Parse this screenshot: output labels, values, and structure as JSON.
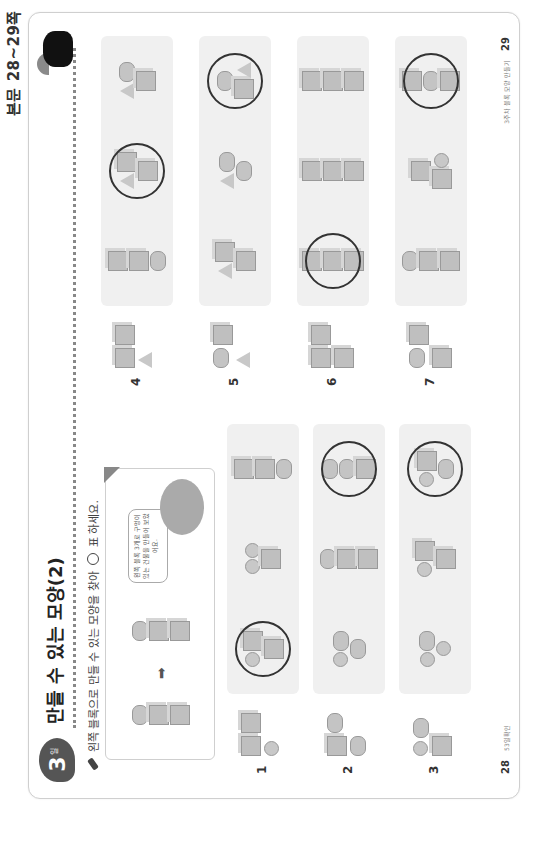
{
  "header": {
    "page_ref": "본문 28~29쪽"
  },
  "lesson": {
    "day_number": "3",
    "day_unit": "일",
    "title": "만들 수 있는 모양(2)",
    "instruction_prefix": "왼쪽 블록으로 만들 수 있는 모양을 찾아",
    "instruction_suffix": "표 하세요."
  },
  "example": {
    "arrow": "➡",
    "speech_bubble": "왼쪽 블록 3개로 구멍이 있는 건물을 만들어 보았어요."
  },
  "problems": [
    {
      "number": "1",
      "given": [
        "cube",
        "cube",
        "sphere"
      ],
      "choices": [
        {
          "shapes": [
            "sphere",
            "cube",
            "cube"
          ],
          "circled": true
        },
        {
          "shapes": [
            "sphere",
            "sphere",
            "cube"
          ],
          "circled": false
        },
        {
          "shapes": [
            "cube",
            "cube",
            "cylinder"
          ],
          "circled": false
        }
      ]
    },
    {
      "number": "2",
      "given": [
        "cube",
        "cylinder",
        "cylinder"
      ],
      "choices": [
        {
          "shapes": [
            "sphere",
            "cylinder",
            "cylinder"
          ],
          "circled": false
        },
        {
          "shapes": [
            "cylinder",
            "cube",
            "cube"
          ],
          "circled": false
        },
        {
          "shapes": [
            "cylinder",
            "cylinder",
            "cube"
          ],
          "circled": true
        }
      ]
    },
    {
      "number": "3",
      "given": [
        "sphere",
        "cylinder",
        "cube"
      ],
      "choices": [
        {
          "shapes": [
            "sphere",
            "cylinder",
            "sphere"
          ],
          "circled": false
        },
        {
          "shapes": [
            "sphere",
            "cube",
            "cube"
          ],
          "circled": false
        },
        {
          "shapes": [
            "sphere",
            "cube",
            "cylinder"
          ],
          "circled": true
        }
      ]
    },
    {
      "number": "4",
      "given": [
        "cube",
        "cube",
        "cone"
      ],
      "choices": [
        {
          "shapes": [
            "cube",
            "cube",
            "cylinder"
          ],
          "circled": false
        },
        {
          "shapes": [
            "cone",
            "cube",
            "cube"
          ],
          "circled": true
        },
        {
          "shapes": [
            "cone",
            "cylinder",
            "cube"
          ],
          "circled": false
        }
      ]
    },
    {
      "number": "5",
      "given": [
        "cylinder",
        "cube",
        "cone"
      ],
      "choices": [
        {
          "shapes": [
            "cone",
            "cube",
            "cube"
          ],
          "circled": false
        },
        {
          "shapes": [
            "cone",
            "cylinder",
            "cylinder"
          ],
          "circled": false
        },
        {
          "shapes": [
            "cylinder",
            "cube",
            "cone"
          ],
          "circled": true
        }
      ]
    },
    {
      "number": "6",
      "given": [
        "cube",
        "cube",
        "cube"
      ],
      "choices": [
        {
          "shapes": [
            "cube",
            "cube",
            "cube"
          ],
          "circled": true
        },
        {
          "shapes": [
            "cube",
            "cube",
            "cube"
          ],
          "circled": false
        },
        {
          "shapes": [
            "cube",
            "cube",
            "cube"
          ],
          "circled": false
        }
      ]
    },
    {
      "number": "7",
      "given": [
        "cylinder",
        "cube",
        "cube"
      ],
      "choices": [
        {
          "shapes": [
            "cylinder",
            "cube",
            "cube"
          ],
          "circled": false
        },
        {
          "shapes": [
            "cube",
            "cube",
            "sphere"
          ],
          "circled": false
        },
        {
          "shapes": [
            "cube",
            "cylinder",
            "cube"
          ],
          "circled": true
        }
      ]
    }
  ],
  "footer": {
    "left_page_number": "28",
    "left_caption": "53일확인",
    "right_caption": "3주차 블록 모양 만들기",
    "right_page_number": "29"
  }
}
